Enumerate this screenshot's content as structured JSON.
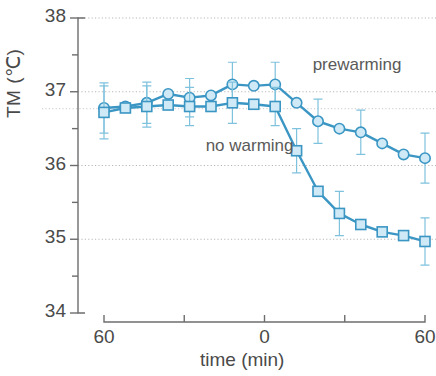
{
  "chart_data": {
    "type": "line",
    "title": "",
    "xlabel": "time  (min)",
    "ylabel": "TM  (℃)",
    "xlim": [
      -75,
      60
    ],
    "ylim": [
      34,
      38
    ],
    "grid": true,
    "grid_y": [
      38,
      37,
      36,
      35
    ],
    "x_ticks": [
      -60,
      -30,
      0,
      30,
      60
    ],
    "x_tick_labels": [
      "60",
      "",
      "0",
      "",
      "60"
    ],
    "y_ticks": [
      34,
      34.5,
      35,
      35.5,
      36,
      36.5,
      37,
      37.5,
      38
    ],
    "y_tick_labels": [
      "34",
      "",
      "35",
      "",
      "36",
      "",
      "37",
      "",
      "38"
    ],
    "legend_position": "inline-annotation",
    "accent_color": "#3b96c4",
    "marker_fill": "#cfeaf6",
    "series": [
      {
        "name": "prewarming",
        "marker": "circle",
        "label_x": 18,
        "label_y": 37.35,
        "x": [
          -60,
          -52,
          -44,
          -36,
          -28,
          -20,
          -12,
          -4,
          4,
          12,
          20,
          28,
          36,
          44,
          52,
          60
        ],
        "values": [
          36.78,
          36.8,
          36.85,
          36.97,
          36.92,
          36.95,
          37.1,
          37.08,
          37.1,
          36.85,
          36.6,
          36.5,
          36.45,
          36.3,
          36.15,
          36.1
        ],
        "err": [
          0.34,
          0,
          0.28,
          0,
          0.26,
          0,
          0.3,
          0,
          0.3,
          0,
          0.3,
          0,
          0.3,
          0,
          0,
          0.34
        ]
      },
      {
        "name": "no warming",
        "marker": "square",
        "label_x": -22,
        "label_y": 36.25,
        "x": [
          -60,
          -52,
          -44,
          -36,
          -28,
          -20,
          -12,
          -4,
          4,
          12,
          20,
          28,
          36,
          44,
          52,
          60
        ],
        "values": [
          36.72,
          36.78,
          36.8,
          36.82,
          36.8,
          36.8,
          36.85,
          36.83,
          36.8,
          36.2,
          35.65,
          35.35,
          35.2,
          35.1,
          35.05,
          34.97
        ],
        "err": [
          0.36,
          0,
          0.28,
          0,
          0.26,
          0,
          0.28,
          0,
          0.26,
          0.3,
          0,
          0.3,
          0,
          0,
          0,
          0.32
        ]
      }
    ]
  }
}
